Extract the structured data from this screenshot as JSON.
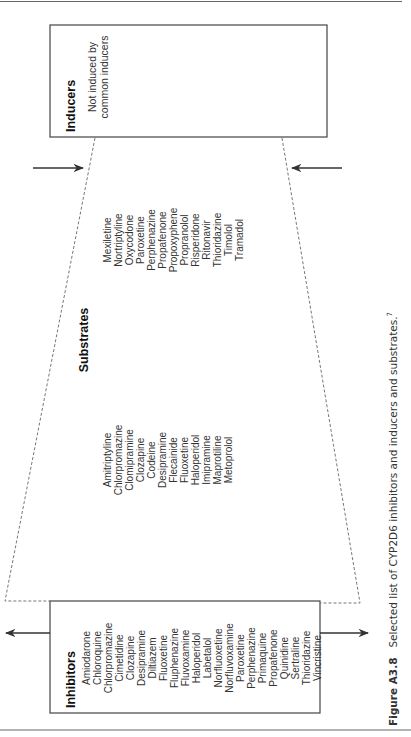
{
  "figure": {
    "caption_label": "Figure A3.8",
    "caption_text": "Selected list of CYP2D6 inhibitors and inducers and substrates.",
    "caption_ref": "7"
  },
  "inducers": {
    "title": "Inducers",
    "lines": [
      "Not induced by",
      "common inducers"
    ]
  },
  "substrates": {
    "title": "Substrates",
    "column1": [
      "Amitriptyline",
      "Chlorpromazine",
      "Clomipramine",
      "Clozapine",
      "Codeine",
      "Desipramine",
      "Flecainide",
      "Fluoxetine",
      "Haloperidol",
      "Imipramine",
      "Maprotiline",
      "Metoprolol"
    ],
    "column2": [
      "Mexiletine",
      "Nortriptyline",
      "Oxycodone",
      "Paroxetine",
      "Perphenazine",
      "Propafenone",
      "Propoxyphene",
      "Propranolol",
      "Risperidone",
      "Ritonavir",
      "Thioridazine",
      "Timolol",
      "Tramadol"
    ]
  },
  "inhibitors": {
    "title": "Inhibitors",
    "items": [
      "Amiodarone",
      "Chloroquine",
      "Chlorpromazine",
      "Cimetidine",
      "Clozapine",
      "Desipramine",
      "Diltiazem",
      "Fluoxetine",
      "Fluphenazine",
      "Fluvoxamine",
      "Haloperidol",
      "Labetalol",
      "Norfluoxetine",
      "Norfluvoxamine",
      "Paroxetine",
      "Perphenazine",
      "Primaquine",
      "Propafenone",
      "Quinidine",
      "Sertraline",
      "Thioridazine",
      "Vincristine"
    ]
  },
  "colors": {
    "line": "#444444",
    "dash": "#777777",
    "text": "#222222"
  }
}
